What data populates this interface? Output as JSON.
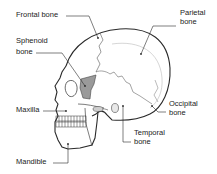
{
  "diagram": {
    "labels": {
      "frontal": "Frontal bone",
      "parietal_1": "Parietal",
      "parietal_2": "bone",
      "sphenoid_1": "Sphenoid",
      "sphenoid_2": "bone",
      "maxilla": "Maxilla",
      "occipital_1": "Occipital",
      "occipital_2": "bone",
      "temporal_1": "Temporal",
      "temporal_2": "bone",
      "mandible": "Mandible"
    },
    "colors": {
      "outline": "#2a2a2a",
      "sphenoid_fill": "#9a9a9a",
      "background": "#ffffff",
      "text": "#222222"
    }
  }
}
